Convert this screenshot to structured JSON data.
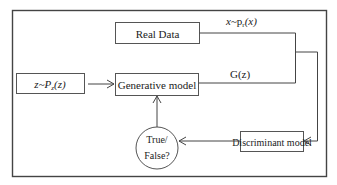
{
  "diagram": {
    "nodes": {
      "real_data": {
        "label": "Real Data"
      },
      "noise": {
        "label_var": "z",
        "label_tilde": "~",
        "label_dist": "P",
        "label_sub": "z",
        "label_arg": "(z)"
      },
      "generator": {
        "label": "Generative model"
      },
      "discriminator": {
        "label": "Discriminant model"
      },
      "decision": {
        "line1": "True/",
        "line2": "False?"
      }
    },
    "edges": {
      "real_sample": {
        "var": "x",
        "tilde": "~",
        "dist": "p",
        "sub": "r",
        "arg": "(x)"
      },
      "generated_sample": {
        "label": "G(z)"
      }
    },
    "colors": {
      "stroke": "#444444",
      "text": "#222222",
      "background": "#ffffff"
    }
  }
}
